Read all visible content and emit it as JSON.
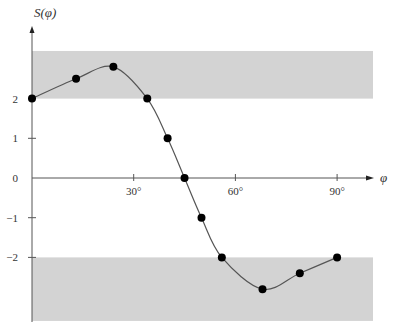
{
  "chart_data": {
    "type": "line",
    "title": "",
    "xlabel": "φ",
    "ylabel": "S(φ)",
    "x_ticks": [
      "30°",
      "60°",
      "90°"
    ],
    "x_tick_values": [
      30,
      60,
      90
    ],
    "y_ticks": [
      "2",
      "1",
      "0",
      "−1",
      "−2"
    ],
    "y_tick_values": [
      2,
      1,
      0,
      -1,
      -2
    ],
    "xlim": [
      0,
      100
    ],
    "ylim": [
      -3.6,
      3.7
    ],
    "grid": false,
    "legend": null,
    "shaded_bands": [
      {
        "y_from": 2,
        "y_to": 3.2,
        "color": "#d3d3d3"
      },
      {
        "y_from": -3.6,
        "y_to": -2,
        "color": "#d3d3d3"
      }
    ],
    "series": [
      {
        "name": "S(φ)",
        "marker": "filled-circle",
        "x": [
          0,
          13,
          24,
          34,
          40,
          45,
          50,
          56,
          68,
          79,
          90
        ],
        "values": [
          2.0,
          2.5,
          2.8,
          2.0,
          1.0,
          0.0,
          -1.0,
          -2.0,
          -2.8,
          -2.4,
          -2.0
        ]
      }
    ]
  },
  "colors": {
    "band": "#d3d3d3",
    "line": "#555555",
    "marker": "#000000",
    "axis": "#555555"
  }
}
